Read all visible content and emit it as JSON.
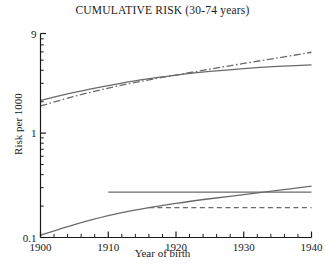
{
  "chart_data": {
    "type": "line",
    "title": "CUMULATIVE RISK (30-74 years)",
    "xlabel": "Year of birth",
    "ylabel": "Risk per 1000",
    "xlim": [
      1900,
      1940
    ],
    "ylim": [
      0.1,
      9
    ],
    "yscale": "log",
    "grid": false,
    "legend": "none",
    "xticks": [
      1900,
      1910,
      1920,
      1930,
      1940
    ],
    "xticklabels": [
      "1900",
      "1910",
      "1920",
      "1930",
      "1940"
    ],
    "xminortick_step": 2,
    "yticks": [
      0.1,
      1,
      9
    ],
    "yticklabels": [
      "0.1",
      "1",
      "9"
    ],
    "yminorticks": [
      0.2,
      0.3,
      0.4,
      0.5,
      0.6,
      0.7,
      0.8,
      0.9,
      2,
      3,
      4,
      5,
      6,
      7,
      8
    ],
    "line_color": "#6a6a6a",
    "axis_color": "#1a1a1a",
    "series": [
      {
        "name": "upper-solid",
        "style": "solid",
        "x": [
          1900,
          1905,
          1910,
          1915,
          1920,
          1925,
          1930,
          1935,
          1940
        ],
        "y": [
          2.05,
          2.45,
          2.85,
          3.25,
          3.6,
          3.9,
          4.15,
          4.35,
          4.5
        ]
      },
      {
        "name": "upper-dashdot",
        "style": "dashdot",
        "x": [
          1900,
          1905,
          1910,
          1915,
          1920,
          1925,
          1930,
          1935,
          1940
        ],
        "y": [
          1.82,
          2.25,
          2.7,
          3.15,
          3.6,
          4.1,
          4.65,
          5.25,
          5.95
        ]
      },
      {
        "name": "lower-rising-solid",
        "style": "solid",
        "x": [
          1900,
          1905,
          1910,
          1915,
          1920,
          1925,
          1930,
          1935,
          1940
        ],
        "y": [
          0.105,
          0.133,
          0.162,
          0.188,
          0.212,
          0.235,
          0.258,
          0.283,
          0.31
        ]
      },
      {
        "name": "lower-flat-solid",
        "style": "solid",
        "x": [
          1910,
          1940
        ],
        "y": [
          0.272,
          0.272
        ]
      },
      {
        "name": "lower-flat-dashed",
        "style": "dashed",
        "x": [
          1916,
          1940
        ],
        "y": [
          0.193,
          0.193
        ]
      }
    ]
  }
}
